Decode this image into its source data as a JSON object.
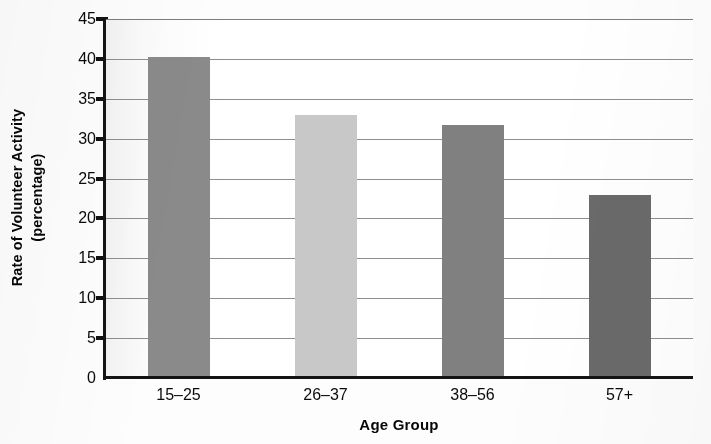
{
  "chart_data": {
    "type": "bar",
    "title": "",
    "subtitle": "",
    "xlabel": "Age Group",
    "ylabel": "Rate of Volunteer Activity (percentage)",
    "ylabel_lines": [
      "Rate of Volunteer Activity",
      "(percentage)"
    ],
    "categories": [
      "15–25",
      "26–37",
      "38–56",
      "57+"
    ],
    "values": [
      40.3,
      33.0,
      31.7,
      23.0
    ],
    "bar_colors": [
      "#8a8a8a",
      "#c8c8c8",
      "#808080",
      "#6a6a6a"
    ],
    "ylim": [
      0,
      45
    ],
    "y_ticks": [
      0,
      5,
      10,
      15,
      20,
      25,
      30,
      35,
      40,
      45
    ],
    "y_tick_labels": [
      "0",
      "5",
      "10",
      "15",
      "20",
      "25",
      "30",
      "35",
      "40",
      "45"
    ],
    "grid": true,
    "grid_axis": "y",
    "legend": false,
    "legend_position": "none",
    "series": [
      {
        "name": "Rate of Volunteer Activity",
        "values": [
          40.3,
          33.0,
          31.7,
          23.0
        ]
      }
    ],
    "annotations": []
  },
  "axes": {
    "y_title_line1": "Rate of Volunteer Activity",
    "y_title_line2": "(percentage)",
    "x_title": "Age Group"
  },
  "colors": {
    "axis": "#141414",
    "gridline": "#8e8e8e",
    "text": "#0a0a0a",
    "plot_background": "#ffffff",
    "page_background": "#fdfdfd"
  }
}
